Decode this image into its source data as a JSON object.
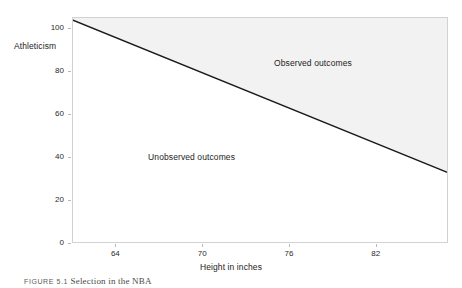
{
  "chart_data": {
    "type": "line",
    "title": "",
    "xlabel": "Height in inches",
    "ylabel": "Athleticism",
    "xlim": [
      61.0,
      87.0
    ],
    "ylim": [
      0,
      105
    ],
    "xticks": [
      64,
      70,
      76,
      82
    ],
    "xticklabels": [
      "64",
      "70",
      "76",
      "82"
    ],
    "yticks": [
      0,
      20,
      40,
      60,
      80,
      100
    ],
    "yticklabels": [
      "0",
      "20",
      "40",
      "60",
      "80",
      "100"
    ],
    "grid": false,
    "legend": "none",
    "series": [
      {
        "name": "selection-frontier",
        "type": "line",
        "x": [
          61.0,
          87.0
        ],
        "y": [
          104.0,
          33.0
        ],
        "color": "#1a1a1a"
      }
    ],
    "shaded_regions": [
      {
        "name": "observed",
        "position": "above-line",
        "color": "#f2f2f2",
        "label": "Observed outcomes"
      },
      {
        "name": "unobserved",
        "position": "below-line",
        "color": "#ffffff",
        "label": "Unobserved outcomes"
      }
    ],
    "annotations": [
      {
        "text": "Observed outcomes",
        "x": 77.6,
        "y": 84.0
      },
      {
        "text": "Unobserved outcomes",
        "x": 69.2,
        "y": 40.5
      }
    ]
  },
  "axes": {
    "y_title": "Athleticism",
    "x_title": "Height in inches"
  },
  "labels": {
    "observed": "Observed outcomes",
    "unobserved": "Unobserved outcomes"
  },
  "caption": {
    "tag": "FIGURE",
    "number": "5.1",
    "text": "Selection in the NBA",
    "full": "FIGURE 5.1 Selection in the NBA"
  },
  "colors": {
    "line": "#1a1a1a",
    "shaded_fill": "#f2f2f2",
    "frame": "#d2d2d2",
    "tick": "#b8b8b8",
    "text": "#1c1c1c",
    "background": "#ffffff"
  }
}
